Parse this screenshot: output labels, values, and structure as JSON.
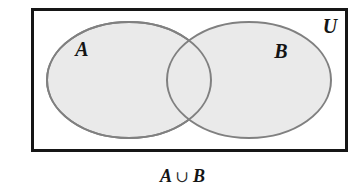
{
  "figure": {
    "universe": {
      "label": "U",
      "name": "universal-set-rectangle"
    },
    "sets": [
      {
        "id": "A",
        "label": "A",
        "name": "set-a-ellipse"
      },
      {
        "id": "B",
        "label": "B",
        "name": "set-b-ellipse"
      }
    ],
    "caption": {
      "left_operand": "A",
      "operator": "∪",
      "right_operand": "B",
      "full": "A ∪ B"
    },
    "shaded_region": "A ∪ B",
    "colors": {
      "background": "#ffffff",
      "rectangle_stroke": "#161616",
      "ellipse_stroke": "#808080",
      "ellipse_fill": "#eaeaea",
      "label_text": "#141414"
    },
    "geometry": {
      "rectangle": {
        "x": 31,
        "y": 8,
        "width": 317,
        "height": 144,
        "stroke_width": 3
      },
      "ellipse_a": {
        "cx": 129,
        "cy": 80,
        "rx": 82,
        "ry": 58
      },
      "ellipse_b": {
        "cx": 249,
        "cy": 80,
        "rx": 82,
        "ry": 58
      },
      "label_a_pos": {
        "x": 82,
        "y": 56
      },
      "label_b_pos": {
        "x": 281,
        "y": 58
      },
      "label_u_pos": {
        "x": 330,
        "y": 33
      },
      "caption_pos": {
        "x": 181,
        "y": 180
      }
    }
  }
}
